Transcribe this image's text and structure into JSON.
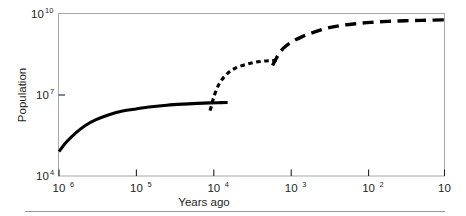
{
  "chart_data": {
    "type": "line",
    "title": "",
    "xlabel": "Years ago",
    "ylabel": "Population",
    "x_scale": "log-reversed",
    "y_scale": "log",
    "xlim": [
      1000000,
      10
    ],
    "ylim": [
      10000,
      10000000000
    ],
    "grid": false,
    "legend": null,
    "x_ticks": [
      {
        "value": 1000000,
        "label": "10",
        "exponent": "6"
      },
      {
        "value": 100000,
        "label": "10",
        "exponent": "5"
      },
      {
        "value": 10000,
        "label": "10",
        "exponent": "4"
      },
      {
        "value": 1000,
        "label": "10",
        "exponent": "3"
      },
      {
        "value": 100,
        "label": "10",
        "exponent": "2"
      },
      {
        "value": 10,
        "label": "10",
        "exponent": ""
      }
    ],
    "y_ticks": [
      {
        "value": 10000000000,
        "label": "10",
        "exponent": "10"
      },
      {
        "value": 10000000,
        "label": "10",
        "exponent": "7"
      },
      {
        "value": 10000,
        "label": "10",
        "exponent": "4"
      }
    ],
    "series": [
      {
        "name": "hunter-gatherer-era",
        "style": "solid",
        "points": [
          [
            1000000,
            80000
          ],
          [
            800000,
            180000
          ],
          [
            600000,
            400000
          ],
          [
            450000,
            750000
          ],
          [
            330000,
            1200000
          ],
          [
            230000,
            1800000
          ],
          [
            150000,
            2500000
          ],
          [
            100000,
            3000000
          ],
          [
            63000,
            3600000
          ],
          [
            40000,
            4100000
          ],
          [
            25000,
            4500000
          ],
          [
            16000,
            4800000
          ],
          [
            11000,
            5000000
          ],
          [
            8000,
            5100000
          ],
          [
            6500,
            5150000
          ]
        ]
      },
      {
        "name": "agricultural-era",
        "style": "dotted",
        "points": [
          [
            11000,
            2600000
          ],
          [
            10500,
            4000000
          ],
          [
            10000,
            7000000
          ],
          [
            9200,
            14000000
          ],
          [
            8200,
            28000000
          ],
          [
            7000,
            50000000
          ],
          [
            5800,
            80000000
          ],
          [
            4600,
            110000000
          ],
          [
            3500,
            140000000
          ],
          [
            2800,
            160000000
          ],
          [
            2200,
            175000000
          ],
          [
            1800,
            182000000
          ],
          [
            1500,
            186000000
          ]
        ]
      },
      {
        "name": "industrial-era",
        "style": "dashed",
        "points": [
          [
            1700,
            120000000
          ],
          [
            1550,
            200000000
          ],
          [
            1400,
            330000000
          ],
          [
            1200,
            560000000
          ],
          [
            950,
            900000000
          ],
          [
            700,
            1400000000
          ],
          [
            480,
            2100000000
          ],
          [
            330,
            2900000000
          ],
          [
            220,
            3600000000
          ],
          [
            140,
            4200000000
          ],
          [
            90,
            4700000000
          ],
          [
            55,
            5100000000
          ],
          [
            32,
            5400000000
          ],
          [
            18,
            5600000000
          ],
          [
            10,
            5800000000
          ]
        ]
      }
    ]
  },
  "figure": {
    "frame_color": "#a8a8a8",
    "line_color": "#000000",
    "background": "#ffffff",
    "rule_color": "#999999"
  }
}
